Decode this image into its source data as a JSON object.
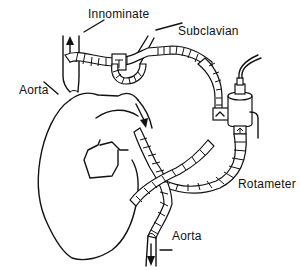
{
  "diagram": {
    "type": "anatomical schematic",
    "labels": {
      "innominate": "Innominate",
      "subclavian": "Subclavian",
      "aorta_upper": "Aorta",
      "aorta_lower": "Aorta",
      "rotameter": "Rotameter"
    },
    "components": [
      {
        "id": "heart",
        "name": "Heart"
      },
      {
        "id": "innominate-artery",
        "name": "Innominate artery",
        "flow": "up"
      },
      {
        "id": "subclavian-artery",
        "name": "Subclavian artery"
      },
      {
        "id": "ascending-aorta",
        "name": "Aorta"
      },
      {
        "id": "bypass-tubing",
        "name": "Segmented bypass tubing"
      },
      {
        "id": "rotameter",
        "name": "Rotameter flow meter"
      },
      {
        "id": "descending-aorta",
        "name": "Aorta",
        "flow": "down"
      }
    ],
    "colors": {
      "line": "#111111",
      "background": "#ffffff"
    }
  }
}
